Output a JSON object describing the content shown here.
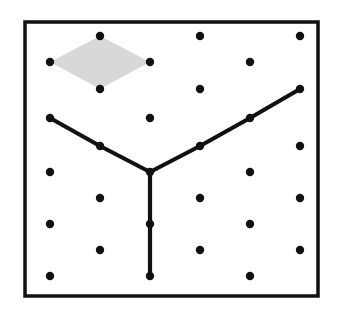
{
  "figure": {
    "canvas": {
      "width": 348,
      "height": 318,
      "background": "#ffffff"
    },
    "frame": {
      "name": "rectangular-border",
      "x": 25,
      "y": 22,
      "width": 293,
      "height": 274,
      "stroke": "#111111",
      "stroke_width": 3.5,
      "fill": "#ffffff"
    },
    "lattice": {
      "description": "staggered triangular dot lattice, 10 rows",
      "dot_radius": 4.2,
      "dot_color": "#111111",
      "row_spacing": 26.5,
      "column_spacing": 100,
      "first_row_y": 36,
      "rows": [
        {
          "index": 1,
          "y": 36,
          "x": [
            100,
            200,
            300
          ]
        },
        {
          "index": 2,
          "y": 62,
          "x": [
            50,
            150,
            250
          ]
        },
        {
          "index": 3,
          "y": 89,
          "x": [
            100,
            200,
            300
          ]
        },
        {
          "index": 4,
          "y": 118,
          "x": [
            50,
            150,
            250
          ]
        },
        {
          "index": 5,
          "y": 146,
          "x": [
            100,
            200,
            300
          ]
        },
        {
          "index": 6,
          "y": 172,
          "x": [
            50,
            150,
            250
          ]
        },
        {
          "index": 7,
          "y": 198,
          "x": [
            100,
            200,
            300
          ]
        },
        {
          "index": 8,
          "y": 224,
          "x": [
            50,
            150,
            250
          ]
        },
        {
          "index": 9,
          "y": 250,
          "x": [
            100,
            200,
            300
          ]
        },
        {
          "index": 10,
          "y": 276,
          "x": [
            50,
            150,
            250
          ]
        }
      ]
    },
    "rhombus": {
      "name": "shaded-rhombus",
      "fill": "#d8d8d8",
      "stroke": "none",
      "vertices": [
        {
          "x": 100,
          "y": 36
        },
        {
          "x": 150,
          "y": 62
        },
        {
          "x": 100,
          "y": 89
        },
        {
          "x": 50,
          "y": 62
        }
      ]
    },
    "path": {
      "name": "y-shaped-polyline",
      "stroke": "#111111",
      "stroke_width": 4.2,
      "junction": {
        "x": 150,
        "y": 172
      },
      "branches": [
        {
          "name": "left-branch",
          "points": [
            {
              "x": 50,
              "y": 118
            },
            {
              "x": 100,
              "y": 146
            },
            {
              "x": 150,
              "y": 172
            }
          ]
        },
        {
          "name": "right-branch",
          "points": [
            {
              "x": 150,
              "y": 172
            },
            {
              "x": 200,
              "y": 146
            },
            {
              "x": 250,
              "y": 118
            },
            {
              "x": 300,
              "y": 89
            }
          ]
        },
        {
          "name": "bottom-branch",
          "points": [
            {
              "x": 150,
              "y": 172
            },
            {
              "x": 150,
              "y": 224
            },
            {
              "x": 150,
              "y": 276
            }
          ]
        }
      ],
      "endpoints": [
        {
          "x": 50,
          "y": 118
        },
        {
          "x": 300,
          "y": 89
        },
        {
          "x": 150,
          "y": 276
        }
      ]
    }
  }
}
